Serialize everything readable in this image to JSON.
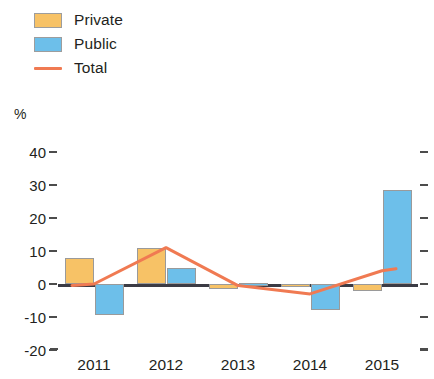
{
  "legend": {
    "items": [
      {
        "label": "Private",
        "type": "swatch",
        "color": "#f7c266"
      },
      {
        "label": "Public",
        "type": "swatch",
        "color": "#6dbfea"
      },
      {
        "label": "Total",
        "type": "line",
        "color": "#f07a52"
      }
    ]
  },
  "axis": {
    "unit_label": "%",
    "y_ticks": [
      "40",
      "30",
      "20",
      "10",
      "0",
      "-10",
      "-20"
    ],
    "x_ticks": [
      "2011",
      "2012",
      "2013",
      "2014",
      "2015"
    ]
  },
  "chart_data": {
    "type": "bar",
    "title": "",
    "subtitle": "",
    "xlabel": "",
    "ylabel": "%",
    "ylim": [
      -20,
      40
    ],
    "y_ticks": [
      40,
      30,
      20,
      10,
      0,
      -10,
      -20
    ],
    "grid": false,
    "legend_position": "top-left",
    "categories": [
      "2011",
      "2012",
      "2013",
      "2014",
      "2015"
    ],
    "series": [
      {
        "name": "Private",
        "type": "bar",
        "color": "#f7c266",
        "values": [
          8.0,
          11.0,
          -1.5,
          -1.0,
          -2.0
        ]
      },
      {
        "name": "Public",
        "type": "bar",
        "color": "#6dbfea",
        "values": [
          -9.5,
          5.0,
          0.3,
          -8.0,
          28.5
        ]
      },
      {
        "name": "Total",
        "type": "line",
        "color": "#f07a52",
        "values": [
          0.0,
          11.0,
          -0.5,
          -3.0,
          4.0
        ]
      }
    ]
  }
}
